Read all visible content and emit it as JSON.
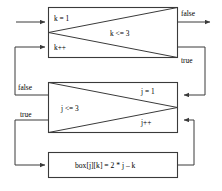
{
  "diagram": {
    "colors": {
      "stroke": "#3a3a3a",
      "text": "#000000",
      "background": "#ffffff"
    },
    "outer_loop": {
      "init_label": "k = 1",
      "increment_label": "k++",
      "condition_label": "k <= 3",
      "false_label": "false",
      "true_label": "true"
    },
    "inner_loop": {
      "init_label": "j = 1",
      "increment_label": "j++",
      "condition_label": "j <= 3",
      "false_label": "false",
      "true_label": "true"
    },
    "body": {
      "statement_label": "box[j][k] = 2 * j – k"
    }
  }
}
